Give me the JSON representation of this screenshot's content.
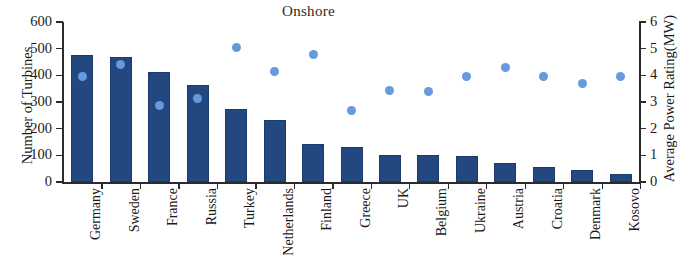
{
  "chart_data": {
    "type": "bar",
    "title": "Onshore",
    "xlabel": "",
    "ylabel": "Number of Turbines",
    "y2label": "Average Power Rating(MW)",
    "ylim": [
      0,
      600
    ],
    "y2lim": [
      0,
      6
    ],
    "yticks": [
      0,
      100,
      200,
      300,
      400,
      500,
      600
    ],
    "y2ticks": [
      0,
      1,
      2,
      3,
      4,
      5,
      6
    ],
    "ytick_labels": [
      "0",
      "100",
      "200",
      "300",
      "400",
      "500",
      "600"
    ],
    "y2tick_labels": [
      "0",
      "1",
      "2",
      "3",
      "4",
      "5",
      "6"
    ],
    "grid": false,
    "legend": "none",
    "categories": [
      "Germany",
      "Sweden",
      "France",
      "Russia",
      "Turkey",
      "Netherlands",
      "Finland",
      "Greece",
      "UK",
      "Belgium",
      "Ukraine",
      "Austria",
      "Croatia",
      "Denmark",
      "Kosovo"
    ],
    "series": [
      {
        "name": "Number of Turbines",
        "type": "bar",
        "axis": "left",
        "color": "#22487f",
        "values": [
          478,
          470,
          412,
          365,
          275,
          232,
          142,
          130,
          100,
          100,
          98,
          72,
          55,
          45,
          30
        ]
      },
      {
        "name": "Average Power Rating(MW)",
        "type": "scatter",
        "axis": "right",
        "color": "#6699dd",
        "values": [
          3.95,
          4.4,
          2.88,
          3.12,
          5.05,
          4.15,
          4.78,
          2.68,
          3.45,
          3.4,
          3.95,
          4.3,
          3.95,
          3.68,
          3.95
        ]
      }
    ]
  }
}
